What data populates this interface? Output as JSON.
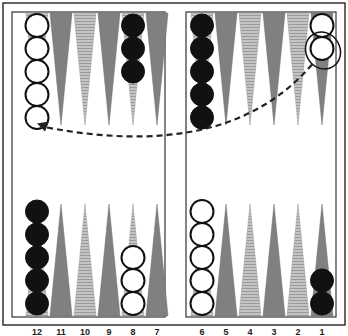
{
  "colors": {
    "frame": "#333333",
    "point_dark": "#808080",
    "point_light": "#b8b8b8",
    "checker_black": "#111111",
    "checker_white": "#ffffff",
    "arrow": "#222222"
  },
  "point_numbers_bottom_left": [
    "12",
    "11",
    "10",
    "9",
    "8",
    "7"
  ],
  "point_numbers_bottom_right": [
    "6",
    "5",
    "4",
    "3",
    "2",
    "1"
  ],
  "checkers": [
    {
      "point": 13,
      "color": "white",
      "count": 5
    },
    {
      "point": 17,
      "color": "black",
      "count": 3
    },
    {
      "point": 19,
      "color": "black",
      "count": 5
    },
    {
      "point": 24,
      "color": "white",
      "count": 2
    },
    {
      "point": 12,
      "color": "black",
      "count": 5
    },
    {
      "point": 8,
      "color": "white",
      "count": 3
    },
    {
      "point": 6,
      "color": "white",
      "count": 5
    },
    {
      "point": 1,
      "color": "black",
      "count": 2
    }
  ],
  "move_arrow": {
    "from_point": 24,
    "to_point": 13,
    "style": "dashed",
    "highlighted_checker": "point 24, second checker"
  }
}
